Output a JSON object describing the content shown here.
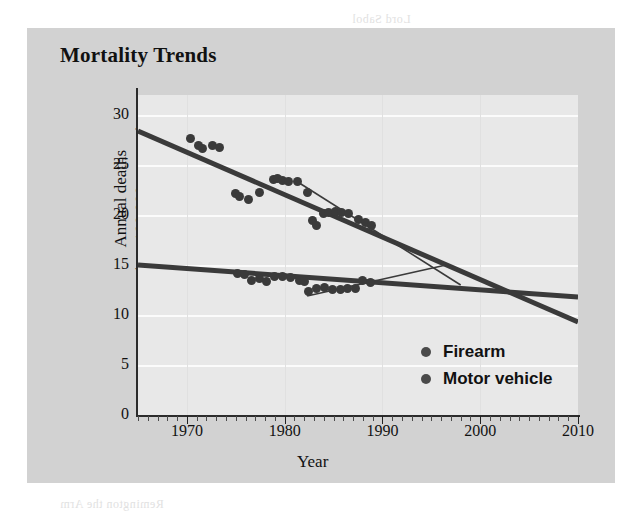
{
  "chart_title": "Mortality Trends",
  "axes": {
    "x_title": "Year",
    "y_title_line1": "Annual deaths",
    "y_title_line2": "(per 100,000 persons)",
    "x_ticks": [
      "1970",
      "1980",
      "1990",
      "2000",
      "2010"
    ],
    "y_ticks": [
      "30",
      "25",
      "20",
      "15",
      "10",
      "5",
      "0"
    ]
  },
  "legend": {
    "items": [
      {
        "label": "Firearm",
        "color": "#4a4a4a"
      },
      {
        "label": "Motor vehicle",
        "color": "#4a4a4a"
      }
    ]
  },
  "bleed_text": {
    "t1": "Lord Sabol",
    "t2": "Mortality Trends following",
    "t3": "Firearm",
    "t4": "a decade of decline in rates of",
    "t5": "accidents and",
    "t6": "deaths from firearm",
    "t7": "Remington the Arm"
  },
  "chart_data": {
    "type": "scatter",
    "title": "Mortality Trends",
    "xlabel": "Year",
    "ylabel": "Annual deaths (per 100,000 persons)",
    "xlim": [
      1965,
      2010
    ],
    "ylim": [
      0,
      32
    ],
    "grid": true,
    "legend_position": "inside-bottom-right",
    "series": [
      {
        "name": "Firearm",
        "color": "#3a3a3a",
        "points": [
          {
            "x": 1970.4,
            "y": 27.7
          },
          {
            "x": 1971.2,
            "y": 27.0
          },
          {
            "x": 1971.6,
            "y": 26.7
          },
          {
            "x": 1972.6,
            "y": 27.0
          },
          {
            "x": 1973.3,
            "y": 26.8
          },
          {
            "x": 1975.0,
            "y": 22.2
          },
          {
            "x": 1975.4,
            "y": 21.9
          },
          {
            "x": 1976.3,
            "y": 21.6
          },
          {
            "x": 1977.4,
            "y": 22.3
          },
          {
            "x": 1978.9,
            "y": 23.6
          },
          {
            "x": 1979.3,
            "y": 23.7
          },
          {
            "x": 1979.8,
            "y": 23.5
          },
          {
            "x": 1980.4,
            "y": 23.4
          },
          {
            "x": 1981.3,
            "y": 23.4
          },
          {
            "x": 1982.3,
            "y": 22.3
          },
          {
            "x": 1982.8,
            "y": 19.5
          },
          {
            "x": 1983.3,
            "y": 19.0
          },
          {
            "x": 1984.0,
            "y": 20.2
          },
          {
            "x": 1984.5,
            "y": 20.3
          },
          {
            "x": 1985.2,
            "y": 20.4
          },
          {
            "x": 1985.8,
            "y": 20.3
          },
          {
            "x": 1986.5,
            "y": 20.2
          },
          {
            "x": 1987.6,
            "y": 19.6
          },
          {
            "x": 1988.3,
            "y": 19.3
          },
          {
            "x": 1988.9,
            "y": 19.0
          }
        ],
        "trend_line": {
          "x0": 1965.0,
          "y0": 28.4,
          "x1": 2010.0,
          "y1": 9.3
        }
      },
      {
        "name": "Motor vehicle",
        "color": "#3a3a3a",
        "points": [
          {
            "x": 1975.2,
            "y": 14.2
          },
          {
            "x": 1975.9,
            "y": 14.1
          },
          {
            "x": 1976.6,
            "y": 13.5
          },
          {
            "x": 1977.4,
            "y": 13.7
          },
          {
            "x": 1978.1,
            "y": 13.4
          },
          {
            "x": 1979.0,
            "y": 13.9
          },
          {
            "x": 1979.8,
            "y": 13.9
          },
          {
            "x": 1980.6,
            "y": 13.8
          },
          {
            "x": 1981.5,
            "y": 13.5
          },
          {
            "x": 1982.0,
            "y": 13.4
          },
          {
            "x": 1982.4,
            "y": 12.4
          },
          {
            "x": 1983.3,
            "y": 12.7
          },
          {
            "x": 1984.1,
            "y": 12.8
          },
          {
            "x": 1984.9,
            "y": 12.6
          },
          {
            "x": 1985.7,
            "y": 12.6
          },
          {
            "x": 1986.4,
            "y": 12.7
          },
          {
            "x": 1987.2,
            "y": 12.7
          },
          {
            "x": 1988.0,
            "y": 13.5
          },
          {
            "x": 1988.8,
            "y": 13.3
          }
        ],
        "trend_line": {
          "x0": 1965.0,
          "y0": 15.0,
          "x1": 2010.0,
          "y1": 11.8
        }
      }
    ],
    "projection_lines": [
      {
        "name": "firearm-projection",
        "x0": 1981.5,
        "y0": 23.2,
        "x1": 1998.0,
        "y1": 13.0
      },
      {
        "name": "motor-vehicle-projection",
        "x0": 1982.3,
        "y0": 11.9,
        "x1": 1996.5,
        "y1": 15.0
      }
    ]
  }
}
